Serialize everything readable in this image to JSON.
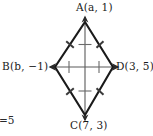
{
  "figure": {
    "type": "geometry-diagram",
    "shape": "kite",
    "stroke_color": "#1a1a1a",
    "diagonal_color": "#5a5a5a",
    "tick_color": "#6a6a6a",
    "background_color": "#ffffff",
    "vertices": [
      {
        "id": "A",
        "label": "A(a, 1)",
        "name": "A",
        "coordinate_x": "a",
        "coordinate_y": "1",
        "position": "top",
        "px": 85,
        "py": 22
      },
      {
        "id": "B",
        "label": "B(b, −1)",
        "name": "B",
        "coordinate_x": "b",
        "coordinate_y": "−1",
        "position": "left",
        "px": 55,
        "py": 67
      },
      {
        "id": "D",
        "label": "D(3, 5)",
        "name": "D",
        "coordinate_x": "3",
        "coordinate_y": "5",
        "position": "right",
        "px": 113,
        "py": 67
      },
      {
        "id": "C",
        "label": "C(7, 3)",
        "name": "C",
        "coordinate_x": "7",
        "coordinate_y": "3",
        "position": "bottom",
        "px": 85,
        "py": 115
      }
    ],
    "sides": [
      {
        "id": "AB",
        "from": "A",
        "to": "B",
        "ticks": 1
      },
      {
        "id": "AD",
        "from": "A",
        "to": "D",
        "ticks": 1
      },
      {
        "id": "BC",
        "from": "B",
        "to": "C",
        "ticks": 1
      },
      {
        "id": "DC",
        "from": "D",
        "to": "C",
        "ticks": 1
      }
    ],
    "diagonals": [
      {
        "id": "AC",
        "from": "A",
        "to": "C",
        "arrowheads": "both",
        "half_ticks": 1
      },
      {
        "id": "BD",
        "from": "B",
        "to": "D",
        "arrowheads": "both",
        "half_ticks": 1
      }
    ],
    "stray_text": "=5"
  }
}
